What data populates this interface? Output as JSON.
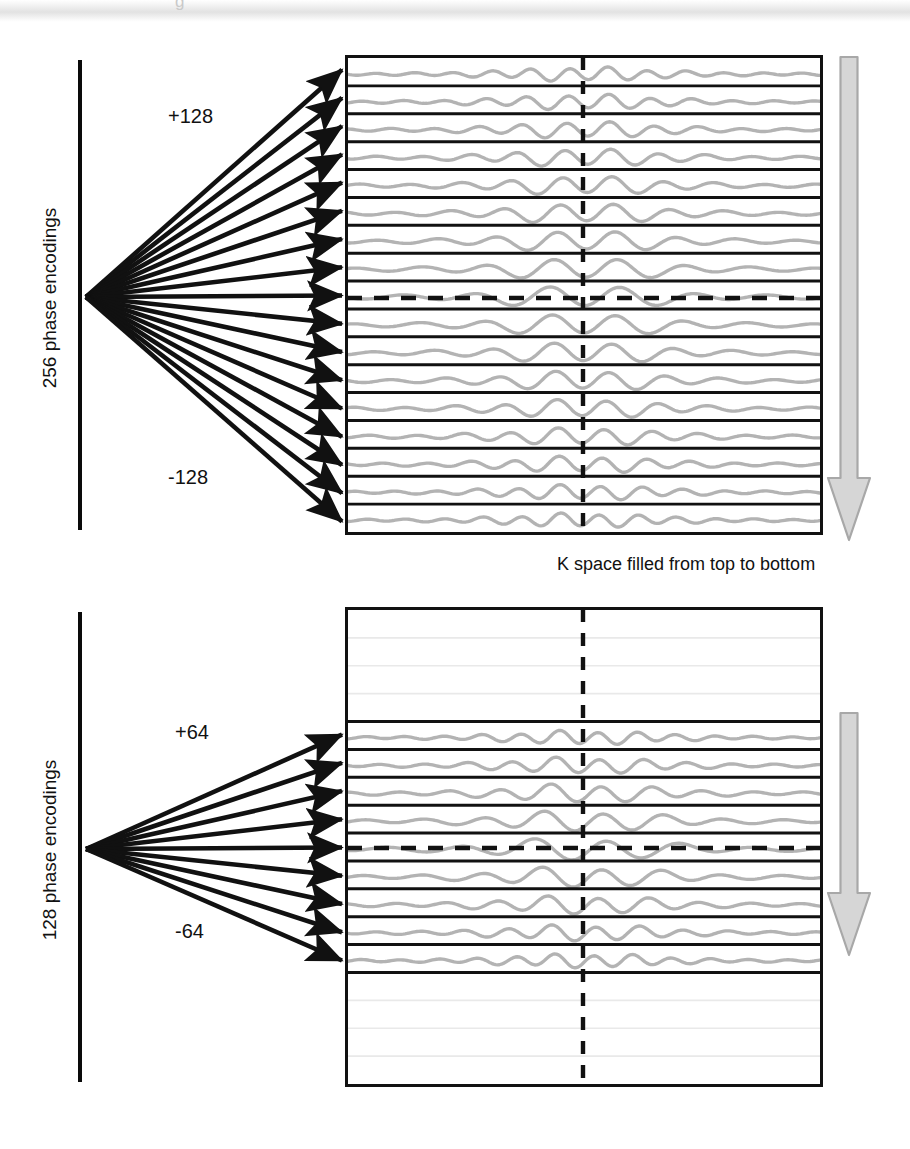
{
  "figure": {
    "title_ghost": "g",
    "caption": "K space filled from top to bottom",
    "colors": {
      "line_black": "#111111",
      "waveform_gray": "#b3b3b3",
      "faint_gray": "#e9e9e9",
      "arrow_gray_fill": "#d6d6d6",
      "arrow_gray_stroke": "#a8a8a8",
      "background": "#ffffff"
    }
  },
  "panels": [
    {
      "id": "panel-256",
      "axis_label": "256 phase encodings",
      "positive_label": "+128",
      "negative_label": "-128",
      "fan_arrow_count": 17,
      "kspace_line_count": 17,
      "filled_rows": 17,
      "unfilled_rows_top": 0,
      "unfilled_rows_bottom": 0,
      "direction_arrow": "down-arrow",
      "box": {
        "x": 345,
        "y": 55,
        "w": 478,
        "h": 480
      },
      "center_dash_x": 583,
      "center_dash_y": 298
    },
    {
      "id": "panel-128",
      "axis_label": "128 phase encodings",
      "positive_label": "+64",
      "negative_label": "-64",
      "fan_arrow_count": 9,
      "kspace_line_count": 9,
      "filled_rows": 9,
      "unfilled_rows_top": 4,
      "unfilled_rows_bottom": 4,
      "direction_arrow": "down-arrow",
      "box": {
        "x": 345,
        "y": 607,
        "w": 478,
        "h": 480
      },
      "center_dash_x": 583,
      "center_dash_y": 848
    }
  ],
  "axis_rules": [
    {
      "name": "axis-rule-256",
      "x": 78,
      "y": 60,
      "h": 470
    },
    {
      "name": "axis-rule-128",
      "x": 78,
      "y": 612,
      "h": 470
    }
  ],
  "chart_data": {
    "type": "diagram",
    "series": [
      {
        "name": "256 phase encodings",
        "encoding_max": 128,
        "encoding_min": -128,
        "total_encodings": 256,
        "drawn_lines": 17,
        "filled_fraction": 1.0
      },
      {
        "name": "128 phase encodings",
        "encoding_max": 64,
        "encoding_min": -64,
        "total_encodings": 128,
        "drawn_lines": 9,
        "filled_fraction": 0.5
      }
    ],
    "annotations": [
      "K space filled from top to bottom"
    ],
    "legend": []
  }
}
